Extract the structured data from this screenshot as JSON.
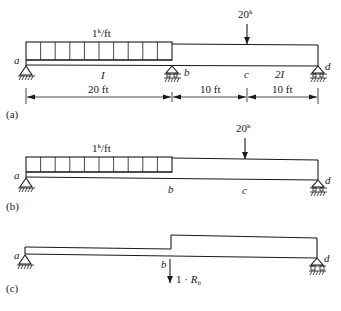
{
  "diagram_a": {
    "caption": "(a)",
    "distributed_load": "1k/ft",
    "distributed_load_value": "1",
    "distributed_load_sup": "k",
    "distributed_load_unit": "/ft",
    "point_load_value": "20",
    "point_load_sup": "k",
    "points": {
      "a": "a",
      "b": "b",
      "c": "c",
      "d": "d"
    },
    "section_left": "I",
    "section_right": "2I",
    "dimensions": [
      "20 ft",
      "10 ft",
      "10 ft"
    ]
  },
  "diagram_b": {
    "caption": "(b)",
    "distributed_load_value": "1",
    "distributed_load_sup": "k",
    "distributed_load_unit": "/ft",
    "point_load_value": "20",
    "point_load_sup": "k",
    "points": {
      "a": "a",
      "b": "b",
      "c": "c",
      "d": "d"
    }
  },
  "diagram_c": {
    "caption": "(c)",
    "points": {
      "a": "a",
      "b": "b",
      "d": "d"
    },
    "redundant_load_prefix": "1 · ",
    "redundant_load_symbol": "R",
    "redundant_load_sub": "b"
  }
}
